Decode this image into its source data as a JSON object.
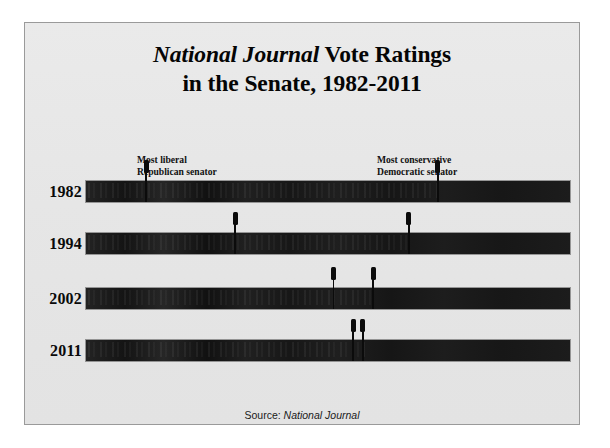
{
  "figure": {
    "title_line1_em": "National Journal",
    "title_line1_rest": " Vote Ratings",
    "title_line2": "in the Senate, 1982-2011",
    "source_prefix": "Source: ",
    "source_publication": "National Journal",
    "background_color": "#e8e8e8",
    "bar_color": "#1b1b1b",
    "marker_color": "#0b0b0b",
    "frame_color": "#9a9a9a"
  },
  "annotations": {
    "left": {
      "line1": "Most liberal",
      "line2": "Republican senator"
    },
    "right": {
      "line1": "Most conservative",
      "line2": "Democratic senator"
    }
  },
  "chart_data": {
    "type": "bar",
    "title": "National Journal Vote Ratings in the Senate, 1982-2011",
    "subtitle": "",
    "xlabel": "Ideological spectrum (liberal to conservative)",
    "ylabel": "Year",
    "categories": [
      "1982",
      "1994",
      "2002",
      "2011"
    ],
    "grid": false,
    "legend_position": "none",
    "xlim": [
      0,
      100
    ],
    "series": [
      {
        "name": "Most liberal Republican senator",
        "values": [
          12.4,
          30.8,
          51.2,
          55.2
        ]
      },
      {
        "name": "Most conservative Democratic senator",
        "values": [
          72.7,
          66.7,
          59.3,
          57.2
        ]
      }
    ],
    "rows": [
      {
        "year": "1982",
        "most_liberal_republican": 12.4,
        "most_conservative_democrat": 72.7,
        "overlap_width": 60.3
      },
      {
        "year": "1994",
        "most_liberal_republican": 30.8,
        "most_conservative_democrat": 66.7,
        "overlap_width": 35.9
      },
      {
        "year": "2002",
        "most_liberal_republican": 51.2,
        "most_conservative_democrat": 59.3,
        "overlap_width": 8.1
      },
      {
        "year": "2011",
        "most_liberal_republican": 55.2,
        "most_conservative_democrat": 57.2,
        "overlap_width": 2.0
      }
    ]
  }
}
